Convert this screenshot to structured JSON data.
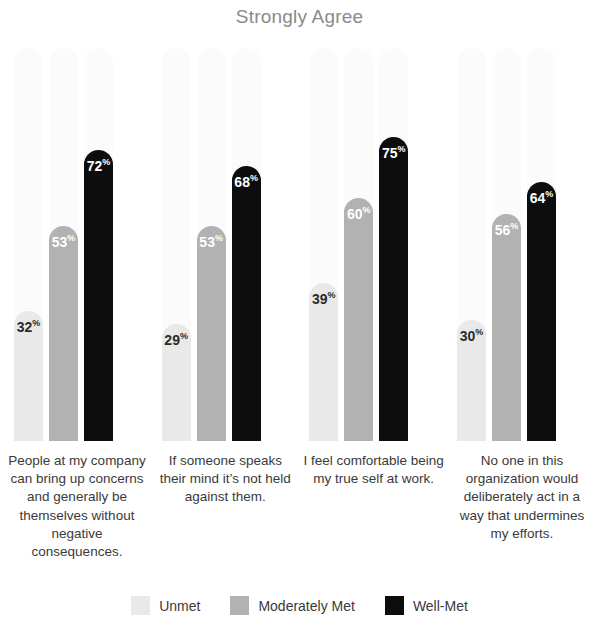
{
  "chart_data": {
    "type": "bar",
    "title": "Strongly Agree",
    "xlabel": "",
    "ylabel": "",
    "ylim": [
      0,
      100
    ],
    "grid": false,
    "legend_position": "bottom",
    "value_suffix": "%",
    "categories": [
      "People at my company can bring up concerns and generally be themselves without negative consequences.",
      "If someone speaks their mind it’s not held against them.",
      "I feel comfortable being my true self at work.",
      "No one in this organization would deliberately act in a way that undermines my efforts."
    ],
    "series": [
      {
        "name": "Unmet",
        "color": "#e9e9e9",
        "values": [
          32,
          29,
          39,
          30
        ]
      },
      {
        "name": "Moderately Met",
        "color": "#b2b2b2",
        "values": [
          53,
          53,
          60,
          56
        ]
      },
      {
        "name": "Well-Met",
        "color": "#0d0d0d",
        "values": [
          72,
          68,
          75,
          64
        ]
      }
    ]
  },
  "groups": [
    {
      "label": "People at my company can bring up concerns and generally be themselves without negative consequences.",
      "bars": [
        {
          "series": "Unmet",
          "value": "32",
          "suffix": "%"
        },
        {
          "series": "Moderately Met",
          "value": "53",
          "suffix": "%"
        },
        {
          "series": "Well-Met",
          "value": "72",
          "suffix": "%"
        }
      ]
    },
    {
      "label": "If someone speaks their mind it’s not held against them.",
      "bars": [
        {
          "series": "Unmet",
          "value": "29",
          "suffix": "%"
        },
        {
          "series": "Moderately Met",
          "value": "53",
          "suffix": "%"
        },
        {
          "series": "Well-Met",
          "value": "68",
          "suffix": "%"
        }
      ]
    },
    {
      "label": "I feel comfortable being my true self at work.",
      "bars": [
        {
          "series": "Unmet",
          "value": "39",
          "suffix": "%"
        },
        {
          "series": "Moderately Met",
          "value": "60",
          "suffix": "%"
        },
        {
          "series": "Well-Met",
          "value": "75",
          "suffix": "%"
        }
      ]
    },
    {
      "label": "No one in this organization would deliberately act in a way that undermines my efforts.",
      "bars": [
        {
          "series": "Unmet",
          "value": "30",
          "suffix": "%"
        },
        {
          "series": "Moderately Met",
          "value": "56",
          "suffix": "%"
        },
        {
          "series": "Well-Met",
          "value": "64",
          "suffix": "%"
        }
      ]
    }
  ],
  "legend": {
    "items": [
      {
        "label": "Unmet",
        "color": "#e9e9e9"
      },
      {
        "label": "Moderately Met",
        "color": "#b2b2b2"
      },
      {
        "label": "Well-Met",
        "color": "#0d0d0d"
      }
    ]
  }
}
